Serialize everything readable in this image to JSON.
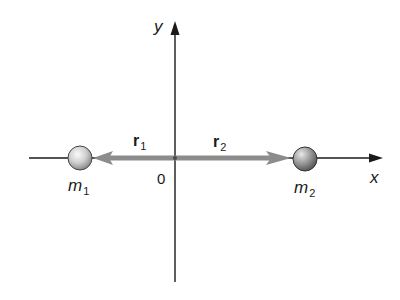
{
  "diagram": {
    "axes": {
      "x_label": "x",
      "y_label": "y",
      "origin_label": "0"
    },
    "masses": [
      {
        "name": "m",
        "subscript": "1",
        "position": "left"
      },
      {
        "name": "m",
        "subscript": "2",
        "position": "right"
      }
    ],
    "vectors": [
      {
        "name": "r",
        "subscript": "1",
        "direction": "left",
        "from": "origin",
        "to": "m1"
      },
      {
        "name": "r",
        "subscript": "2",
        "direction": "right",
        "from": "origin",
        "to": "m2"
      }
    ],
    "colors": {
      "axis": "#1a1a1a",
      "vector": "#8c8c8c",
      "mass_light": "#f2f2f2",
      "mass_dark": "#7a7a7a",
      "background": "#ffffff"
    }
  }
}
